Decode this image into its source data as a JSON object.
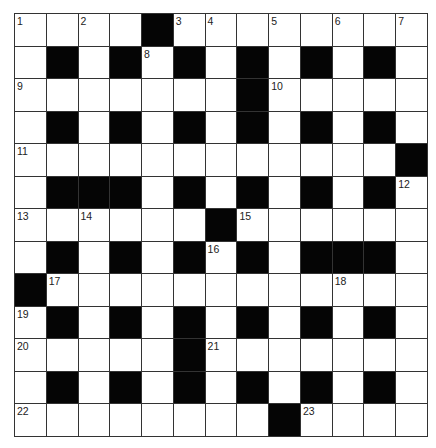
{
  "puzzle": {
    "type": "crossword",
    "rows": 13,
    "cols": 13,
    "colors": {
      "block": "#050505",
      "cell": "#ffffff",
      "gridline": "#333333",
      "number": "#222222"
    },
    "layout": [
      "....#........",
      ".#.#.#.#.#.#.",
      ".......#.....",
      ".#.#.#.#.#.#.",
      "............#",
      ".###.#.#.#.#.",
      "......#......",
      ".#.#.#.#.###.",
      "#............",
      ".#.#.#.#.#.#.",
      ".....#.......",
      ".#.#.#.#.#.#.",
      "........#...."
    ],
    "numbers": [
      {
        "row": 0,
        "col": 0,
        "n": "1"
      },
      {
        "row": 0,
        "col": 2,
        "n": "2"
      },
      {
        "row": 0,
        "col": 5,
        "n": "3"
      },
      {
        "row": 0,
        "col": 6,
        "n": "4"
      },
      {
        "row": 0,
        "col": 8,
        "n": "5"
      },
      {
        "row": 0,
        "col": 10,
        "n": "6"
      },
      {
        "row": 0,
        "col": 12,
        "n": "7"
      },
      {
        "row": 1,
        "col": 4,
        "n": "8"
      },
      {
        "row": 2,
        "col": 0,
        "n": "9"
      },
      {
        "row": 2,
        "col": 8,
        "n": "10"
      },
      {
        "row": 4,
        "col": 0,
        "n": "11"
      },
      {
        "row": 5,
        "col": 12,
        "n": "12"
      },
      {
        "row": 6,
        "col": 0,
        "n": "13"
      },
      {
        "row": 6,
        "col": 2,
        "n": "14"
      },
      {
        "row": 6,
        "col": 7,
        "n": "15"
      },
      {
        "row": 7,
        "col": 6,
        "n": "16"
      },
      {
        "row": 8,
        "col": 1,
        "n": "17"
      },
      {
        "row": 8,
        "col": 10,
        "n": "18"
      },
      {
        "row": 9,
        "col": 0,
        "n": "19"
      },
      {
        "row": 10,
        "col": 0,
        "n": "20"
      },
      {
        "row": 10,
        "col": 6,
        "n": "21"
      },
      {
        "row": 12,
        "col": 0,
        "n": "22"
      },
      {
        "row": 12,
        "col": 9,
        "n": "23"
      }
    ],
    "entries": {}
  }
}
